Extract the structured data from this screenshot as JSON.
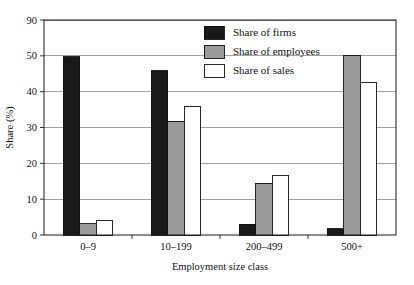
{
  "chart_data": {
    "type": "bar",
    "title": "",
    "subtitle": "",
    "xlabel": "Employment size class",
    "ylabel": "Share (%)",
    "categories": [
      "0–9",
      "10–199",
      "200–499",
      "500+"
    ],
    "series": [
      {
        "name": "Share of firms",
        "values": [
          49.8,
          45.8,
          3.0,
          1.8
        ],
        "color": "#1a1a1a"
      },
      {
        "name": "Share of employees",
        "values": [
          3.2,
          31.8,
          14.5,
          50.0
        ],
        "color": "#9a9a9a"
      },
      {
        "name": "Share of sales",
        "values": [
          4.0,
          36.0,
          16.5,
          42.5
        ],
        "color": "#ffffff"
      }
    ],
    "ylim": [
      0,
      60
    ],
    "yticks": [
      0,
      10,
      20,
      30,
      40,
      50,
      60
    ],
    "ytick_labels": [
      "0",
      "10",
      "20",
      "30",
      "40",
      "50",
      "90"
    ],
    "grid": true,
    "grid_axis": "y",
    "legend_position": "top-center-right",
    "axis_color": "#1a1a1a",
    "grid_color": "#8a8a8a",
    "background_color": "#ffffff"
  }
}
